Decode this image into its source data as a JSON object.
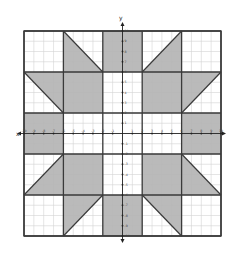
{
  "diagram": {
    "type": "coordinate-plane quilt pattern",
    "x_axis_label": "x",
    "y_axis_label": "y",
    "x_range": [
      -10,
      10
    ],
    "y_range": [
      -10,
      10
    ],
    "grid_step": 1,
    "block_size": 4,
    "x_ticks": [
      "-10",
      "-9",
      "-8",
      "-7",
      "-6",
      "-5",
      "-4",
      "-3",
      "-2",
      "-1",
      "1",
      "2",
      "3",
      "4",
      "5",
      "6",
      "7",
      "8",
      "9",
      "10"
    ],
    "y_ticks": [
      "10",
      "9",
      "8",
      "7",
      "6",
      "5",
      "4",
      "3",
      "2",
      "1",
      "-1",
      "-2",
      "-3",
      "-4",
      "-5",
      "-6",
      "-7",
      "-8",
      "-9",
      "-10"
    ],
    "colors": {
      "shade": "#b4b4b4",
      "block_border": "#3a3a3a",
      "grid_line": "#d4d4d4",
      "axis": "#222222",
      "background": "#ffffff"
    },
    "shaded_squares": [
      {
        "name": "top-center",
        "x": [
          -2,
          2
        ],
        "y": [
          6,
          10
        ]
      },
      {
        "name": "upper-left-center",
        "x": [
          -6,
          -2
        ],
        "y": [
          2,
          6
        ]
      },
      {
        "name": "upper-right-center",
        "x": [
          2,
          6
        ],
        "y": [
          2,
          6
        ]
      },
      {
        "name": "left-middle",
        "x": [
          -10,
          -6
        ],
        "y": [
          -2,
          2
        ]
      },
      {
        "name": "right-middle",
        "x": [
          6,
          10
        ],
        "y": [
          -2,
          2
        ]
      },
      {
        "name": "lower-left-center",
        "x": [
          -6,
          -2
        ],
        "y": [
          -6,
          -2
        ]
      },
      {
        "name": "lower-right-center",
        "x": [
          2,
          6
        ],
        "y": [
          -6,
          -2
        ]
      },
      {
        "name": "bottom-center",
        "x": [
          -2,
          2
        ],
        "y": [
          -10,
          -6
        ]
      }
    ],
    "shaded_triangles": [
      {
        "name": "top-left-triangle",
        "points": [
          [
            -6,
            10
          ],
          [
            -2,
            6
          ],
          [
            -6,
            6
          ]
        ]
      },
      {
        "name": "top-right-triangle",
        "points": [
          [
            2,
            6
          ],
          [
            6,
            10
          ],
          [
            6,
            6
          ]
        ]
      },
      {
        "name": "upper-left-side-triangle",
        "points": [
          [
            -10,
            6
          ],
          [
            -6,
            6
          ],
          [
            -6,
            2
          ]
        ]
      },
      {
        "name": "upper-right-side-triangle",
        "points": [
          [
            6,
            2
          ],
          [
            6,
            6
          ],
          [
            10,
            6
          ]
        ]
      },
      {
        "name": "lower-left-side-triangle",
        "points": [
          [
            -10,
            -6
          ],
          [
            -6,
            -2
          ],
          [
            -6,
            -6
          ]
        ]
      },
      {
        "name": "lower-right-side-triangle",
        "points": [
          [
            6,
            -2
          ],
          [
            10,
            -6
          ],
          [
            6,
            -6
          ]
        ]
      },
      {
        "name": "bottom-left-triangle",
        "points": [
          [
            -6,
            -6
          ],
          [
            -2,
            -6
          ],
          [
            -6,
            -10
          ]
        ]
      },
      {
        "name": "bottom-right-triangle",
        "points": [
          [
            2,
            -6
          ],
          [
            6,
            -6
          ],
          [
            6,
            -10
          ]
        ]
      }
    ]
  }
}
